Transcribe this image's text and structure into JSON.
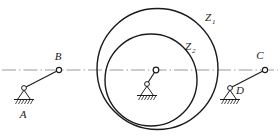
{
  "diagram": {
    "type": "mechanism-kinematic-diagram",
    "background_color": "#ffffff",
    "line_color": "#1a1a1a",
    "centerline_color": "#9a9a9a",
    "labels": {
      "point_a": "A",
      "point_b": "B",
      "point_c": "C",
      "point_d": "D",
      "gear_outer": "Z",
      "gear_outer_sub": "1",
      "gear_inner": "Z",
      "gear_inner_sub": "2"
    },
    "geometry": {
      "centerline": {
        "y": 70,
        "x_start": 2,
        "x_end": 278
      },
      "joint_b": {
        "x": 59,
        "y": 70,
        "r": 2.6
      },
      "joint_c": {
        "x": 265,
        "y": 70,
        "r": 2.6
      },
      "joint_center": {
        "x": 156,
        "y": 70,
        "r": 2.8
      },
      "support_a": {
        "x": 24,
        "y": 88
      },
      "support_d": {
        "x": 230,
        "y": 88
      },
      "support_center": {
        "x": 147,
        "y": 84
      },
      "circle_outer": {
        "cx": 157.5,
        "cy": 69,
        "r": 60.5
      },
      "circle_inner": {
        "cx": 151,
        "cy": 80,
        "r": 46
      },
      "label_z1": {
        "x": 205,
        "y": 21
      },
      "label_z2": {
        "x": 185,
        "y": 50
      },
      "label_a": {
        "x": 23,
        "y": 118
      },
      "label_b": {
        "x": 58,
        "y": 60
      },
      "label_c": {
        "x": 260,
        "y": 59
      },
      "label_d": {
        "x": 240,
        "y": 94
      }
    }
  }
}
